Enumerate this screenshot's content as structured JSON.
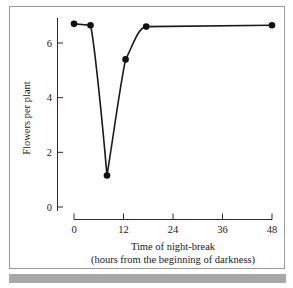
{
  "figure": {
    "background_color": "#ffffff",
    "frame_color": "#9a9a9a",
    "bottom_band_color": "#a8a8a8",
    "line_color": "#1a1a1a",
    "marker_color": "#111111"
  },
  "chart_data": {
    "type": "line",
    "title": "",
    "subtitle": "",
    "xlabel": "Time of night-break",
    "xlabel_line2": "(hours from the beginning of darkness)",
    "ylabel": "Flowers per plant",
    "xlim": [
      0,
      48
    ],
    "ylim": [
      0,
      7.3
    ],
    "xticks": [
      0,
      12,
      24,
      36,
      48
    ],
    "xticklabels": [
      "0",
      "12",
      "24",
      "36",
      "48"
    ],
    "yticks": [
      0,
      2,
      4,
      6
    ],
    "yticklabels": [
      "0",
      "2",
      "4",
      "6"
    ],
    "grid": false,
    "legend": false,
    "legend_position": "none",
    "markers": "filled-circle",
    "series": [
      {
        "name": "Flowers per plant",
        "x": [
          0,
          4,
          8,
          12.5,
          17.5,
          48
        ],
        "y": [
          6.7,
          6.65,
          1.15,
          5.4,
          6.6,
          6.65
        ]
      }
    ],
    "annotations": []
  }
}
